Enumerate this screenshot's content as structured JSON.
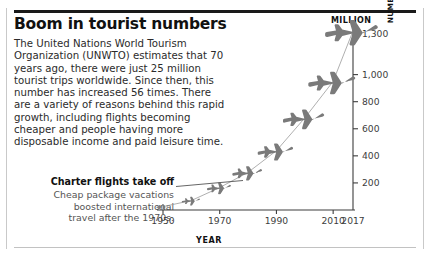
{
  "title": "Boom in tourist numbers",
  "body": "The United Nations World Tourism Organization (UNWTO) estimates that 70 years ago, there were just 25 million tourist trips worldwide. Since then, this number has increased 56 times. There are a variety of reasons behind this rapid growth, including flights becoming cheaper and people having more disposable income and paid leisure time.",
  "callout": {
    "title": "Charter flights take off",
    "line1": "Cheap package vacations",
    "line2": "boosted international",
    "line3": "travel after the 1970s."
  },
  "axes": {
    "unit_label": "MILLION",
    "y_label_line1": "NUMBER OF INTERNATIONAL TOURIST",
    "y_label_line2": "ARRIVALS GLOBALLY",
    "x_label": "YEAR"
  },
  "chart_data": {
    "type": "line",
    "title": "Boom in tourist numbers",
    "subtitle": "",
    "xlabel": "YEAR",
    "ylabel": "NUMBER OF INTERNATIONAL TOURIST ARRIVALS GLOBALLY",
    "unit": "MILLION",
    "grid": false,
    "legend": false,
    "marker_style": "airplane-silhouette",
    "xlim": [
      1950,
      2017
    ],
    "ylim": [
      0,
      1300
    ],
    "x_ticks": [
      1950,
      1970,
      1990,
      2010,
      2017
    ],
    "x_tick_labels": [
      "1950",
      "1970",
      "1990",
      "2010",
      "2017"
    ],
    "y_ticks": [
      200,
      400,
      600,
      800,
      1000,
      1300
    ],
    "y_tick_labels": [
      "200",
      "400",
      "600",
      "800",
      "1,000",
      "1,300"
    ],
    "x": [
      1950,
      1960,
      1970,
      1980,
      1990,
      2000,
      2010,
      2017
    ],
    "values": [
      25,
      70,
      166,
      278,
      438,
      680,
      950,
      1323
    ],
    "series": [
      {
        "name": "International tourist arrivals",
        "values": [
          25,
          70,
          166,
          278,
          438,
          680,
          950,
          1323
        ]
      }
    ],
    "annotations": [
      {
        "text": "Charter flights take off",
        "detail": "Cheap package vacations boosted international travel after the 1970s.",
        "x": 1972,
        "y": 180
      }
    ]
  },
  "colors": {
    "plane": "#7a7a7a",
    "axis": "#3d3d3d",
    "text": "#2b2b2b",
    "title": "#111111",
    "muted": "#555555",
    "frame": "#c9c9c9"
  }
}
